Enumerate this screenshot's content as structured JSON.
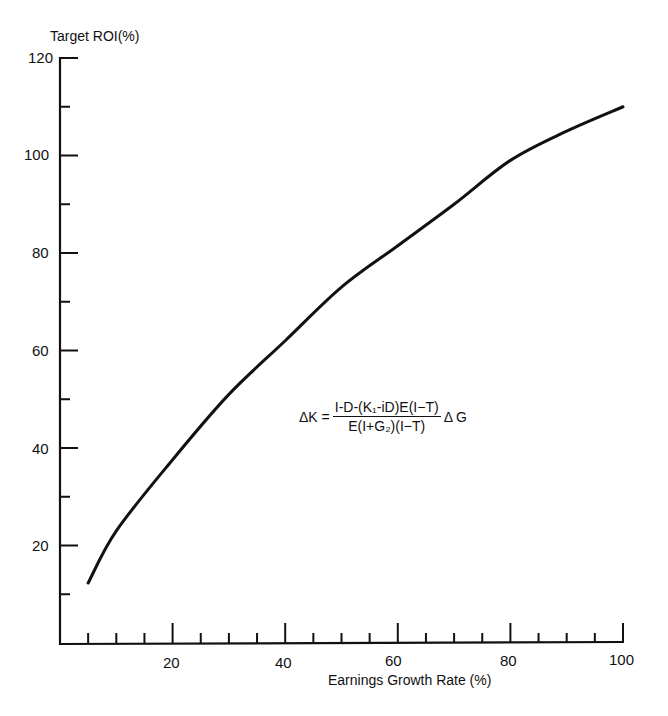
{
  "chart_data": {
    "type": "line",
    "title": "",
    "ylabel": "Target ROI(%)",
    "xlabel": "Earnings Growth Rate (%)",
    "xlim": [
      0,
      100
    ],
    "ylim": [
      0,
      120
    ],
    "x_ticks": [
      20,
      40,
      60,
      80,
      100
    ],
    "y_ticks": [
      20,
      40,
      60,
      80,
      100,
      120
    ],
    "x_minor_step": 5,
    "y_minor_step": 10,
    "grid": false,
    "legend": null,
    "series": [
      {
        "name": "Target ROI",
        "x": [
          5,
          10,
          20,
          30,
          40,
          50,
          60,
          70,
          80,
          90,
          100
        ],
        "y": [
          12.3,
          23,
          37.6,
          51,
          62,
          73,
          81.5,
          90,
          99,
          105,
          110
        ]
      }
    ],
    "annotations": [
      {
        "type": "formula",
        "lhs": "ΔK =",
        "numerator": "I-D-(K₁-iD)E(I−T)",
        "denominator": "E(I+G₂)(I−T)",
        "rhs": "Δ G",
        "position": [
          55,
          42
        ]
      }
    ]
  },
  "labels": {
    "ylabel": "Target ROI(%)",
    "xlabel": "Earnings Growth Rate (%)",
    "formula_lhs": "ΔK =",
    "formula_num": "I-D-(K₁-iD)E(I−T)",
    "formula_den": "E(I+G₂)(I−T)",
    "formula_rhs": "Δ G",
    "y120": "120",
    "y100": "100",
    "y80": "80",
    "y60": "60",
    "y40": "40",
    "y20": "20",
    "x20": "20",
    "x40": "40",
    "x60": "60",
    "x80": "80",
    "x100": "100"
  }
}
